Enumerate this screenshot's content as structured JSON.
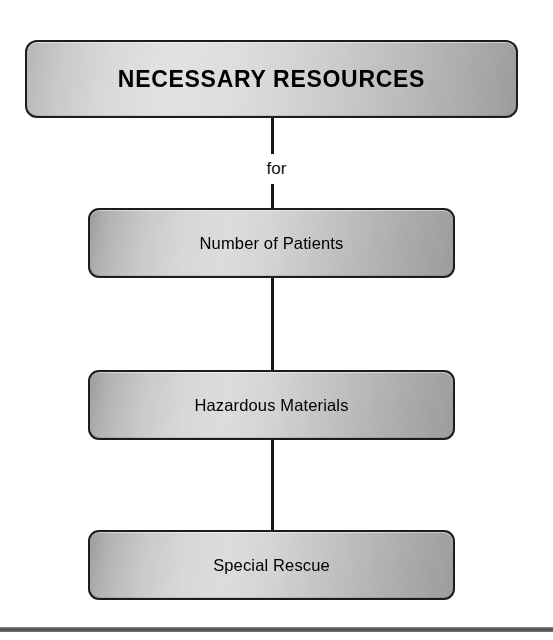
{
  "diagram": {
    "type": "flowchart-vertical-hierarchy",
    "background_color": "#ffffff",
    "header": {
      "label": "NECESSARY RESOURCES"
    },
    "edge_labels": {
      "header_to_first": "for"
    },
    "nodes": [
      {
        "label": "Number of Patients"
      },
      {
        "label": "Hazardous Materials"
      },
      {
        "label": "Special Rescue"
      }
    ],
    "style": {
      "node_border_color": "#1c1c1c",
      "node_fill_light": "#dcdcdc",
      "node_fill_dark": "#9c9c9c",
      "connector_color": "#161616",
      "text_color": "#000000",
      "bottom_rule_color": "#5c5c5c"
    }
  }
}
